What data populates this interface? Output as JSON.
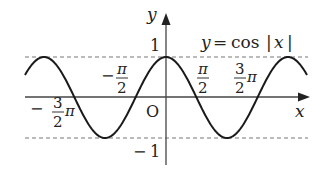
{
  "figure": {
    "function_label": {
      "y": "y",
      "eq": "=",
      "cos": "cos",
      "bar_left": "|",
      "x": "x",
      "bar_right": "|"
    },
    "axes": {
      "x_label": "x",
      "y_label": "y",
      "origin_label": "O"
    },
    "y_ticks": {
      "top": "1",
      "bottom_minus": "−",
      "bottom": "1"
    },
    "x_ticks": {
      "neg_half_pi": {
        "sign": "−",
        "num": "π",
        "den": "2"
      },
      "neg_three_half_pi": {
        "sign": "−",
        "num": "3",
        "den": "2",
        "suffix": "π"
      },
      "half_pi": {
        "num": "π",
        "den": "2"
      },
      "three_half_pi": {
        "num": "3",
        "den": "2",
        "suffix": "π"
      }
    },
    "colors": {
      "curve": "#1a1a1a",
      "axes": "#444444",
      "dashed": "#777777"
    }
  },
  "chart_data": {
    "type": "line",
    "xlabel": "x",
    "ylabel": "y",
    "x_ticks": [
      "-3π/2",
      "-π/2",
      "π/2",
      "3π/2"
    ],
    "y_ticks": [
      1,
      -1
    ],
    "xlim": [
      -6.6,
      7.3
    ],
    "ylim": [
      -1,
      1
    ],
    "series": [
      {
        "name": "y = cos|x|",
        "x": [
          -6.2832,
          -4.7124,
          -3.1416,
          -1.5708,
          0,
          1.5708,
          3.1416,
          4.7124,
          6.2832
        ],
        "y": [
          1,
          0,
          -1,
          0,
          1,
          0,
          -1,
          0,
          1
        ]
      }
    ],
    "reference_lines": [
      {
        "y": 1,
        "style": "dashed"
      },
      {
        "y": -1,
        "style": "dashed"
      }
    ],
    "grid": false
  }
}
